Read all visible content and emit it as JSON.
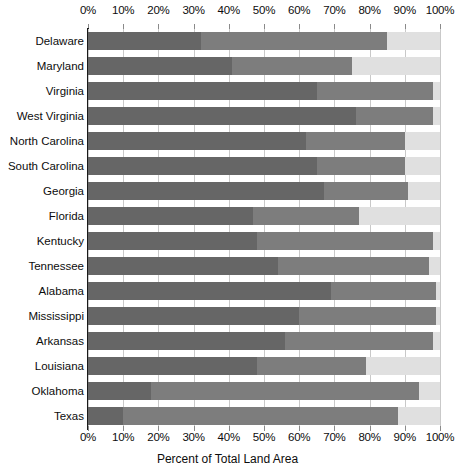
{
  "chart_data": {
    "type": "bar",
    "orientation": "horizontal",
    "stacked": true,
    "title": "",
    "xlabel": "Percent of Total Land Area",
    "ylabel": "",
    "xlim": [
      0,
      100
    ],
    "xticks": [
      0,
      10,
      20,
      30,
      40,
      50,
      60,
      70,
      80,
      90,
      100
    ],
    "xtick_labels": [
      "0%",
      "10%",
      "20%",
      "30%",
      "40%",
      "50%",
      "60%",
      "70%",
      "80%",
      "90%",
      "100%"
    ],
    "grid": true,
    "legend": "none",
    "categories": [
      "Delaware",
      "Maryland",
      "Virginia",
      "West Virginia",
      "North Carolina",
      "South Carolina",
      "Georgia",
      "Florida",
      "Kentucky",
      "Tennessee",
      "Alabama",
      "Mississippi",
      "Arkansas",
      "Louisiana",
      "Oklahoma",
      "Texas"
    ],
    "series": [
      {
        "name": "segment-1",
        "color": "#666666",
        "values": [
          32,
          41,
          65,
          76,
          62,
          65,
          67,
          47,
          48,
          54,
          69,
          60,
          56,
          48,
          18,
          10
        ]
      },
      {
        "name": "segment-2",
        "color": "#7d7d7d",
        "values": [
          53,
          34,
          33,
          22,
          28,
          25,
          24,
          30,
          50,
          43,
          30,
          39,
          42,
          31,
          76,
          78
        ]
      },
      {
        "name": "segment-3",
        "color": "#e0e0e0",
        "values": [
          15,
          25,
          2,
          2,
          10,
          10,
          9,
          23,
          2,
          3,
          1,
          1,
          2,
          21,
          6,
          12
        ]
      }
    ],
    "cumulative": [
      {
        "category": "Delaware",
        "stop1": 32,
        "stop2": 85,
        "stop3": 100
      },
      {
        "category": "Maryland",
        "stop1": 41,
        "stop2": 75,
        "stop3": 100
      },
      {
        "category": "Virginia",
        "stop1": 65,
        "stop2": 98,
        "stop3": 100
      },
      {
        "category": "West Virginia",
        "stop1": 76,
        "stop2": 98,
        "stop3": 100
      },
      {
        "category": "North Carolina",
        "stop1": 62,
        "stop2": 90,
        "stop3": 100
      },
      {
        "category": "South Carolina",
        "stop1": 65,
        "stop2": 90,
        "stop3": 100
      },
      {
        "category": "Georgia",
        "stop1": 67,
        "stop2": 91,
        "stop3": 100
      },
      {
        "category": "Florida",
        "stop1": 47,
        "stop2": 77,
        "stop3": 100
      },
      {
        "category": "Kentucky",
        "stop1": 48,
        "stop2": 98,
        "stop3": 100
      },
      {
        "category": "Tennessee",
        "stop1": 54,
        "stop2": 97,
        "stop3": 100
      },
      {
        "category": "Alabama",
        "stop1": 69,
        "stop2": 99,
        "stop3": 100
      },
      {
        "category": "Mississippi",
        "stop1": 60,
        "stop2": 99,
        "stop3": 100
      },
      {
        "category": "Arkansas",
        "stop1": 56,
        "stop2": 98,
        "stop3": 100
      },
      {
        "category": "Louisiana",
        "stop1": 48,
        "stop2": 79,
        "stop3": 100
      },
      {
        "category": "Oklahoma",
        "stop1": 18,
        "stop2": 94,
        "stop3": 100
      },
      {
        "category": "Texas",
        "stop1": 10,
        "stop2": 88,
        "stop3": 100
      }
    ]
  },
  "colors": {
    "segment_dark": "#666666",
    "segment_medium": "#7d7d7d",
    "segment_light": "#e0e0e0",
    "gridline": "#c9c9c9",
    "axis": "#1a1a1a",
    "text": "#0d0d0d",
    "background": "#ffffff"
  }
}
